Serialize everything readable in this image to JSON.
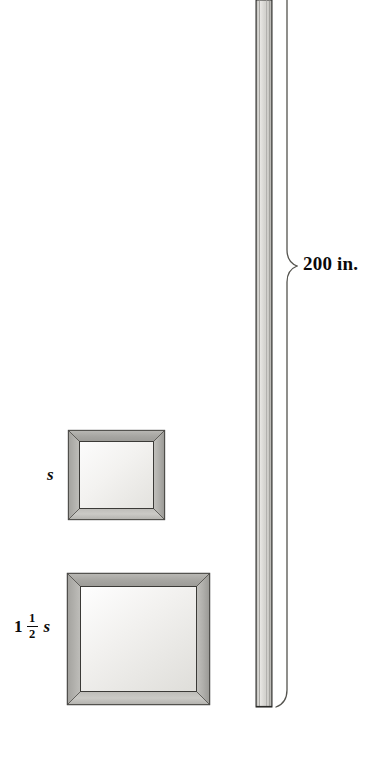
{
  "figure": {
    "type": "geometry-diagram",
    "background_color": "#ffffff",
    "width": 369,
    "height": 782
  },
  "labels": {
    "molding_length": "200 in.",
    "small_frame_side": "s",
    "large_frame_whole": "1",
    "large_frame_numerator": "1",
    "large_frame_denominator": "2",
    "large_frame_variable": "s"
  },
  "objects": {
    "small_frame": {
      "name": "small-picture-frame",
      "x": 68,
      "y": 430,
      "width": 97,
      "height": 90,
      "border_width": 11,
      "side_label": "s"
    },
    "large_frame": {
      "name": "large-picture-frame",
      "x": 67,
      "y": 573,
      "width": 143,
      "height": 132,
      "border_width": 13,
      "side_label": "1 1/2 s"
    },
    "molding_strip": {
      "name": "molding-strip",
      "x": 256,
      "y": 0,
      "width": 16,
      "height": 707,
      "length_label": "200 in."
    },
    "brace": {
      "name": "dimension-brace",
      "x": 281,
      "y_top": 0,
      "y_bottom": 707,
      "tip_y": 266,
      "tip_x": 297
    }
  },
  "colors": {
    "frame_border_light": "#d8d7d3",
    "frame_border_mid": "#a9a8a4",
    "frame_border_dark": "#8e8d89",
    "frame_interior_light": "#fafafa",
    "frame_interior_shade": "#e6e5e2",
    "outline": "#1b1b1b",
    "strip_core": "#d3d2ce",
    "strip_highlight": "#f2f1ef",
    "strip_edge": "#6f6e6b",
    "brace_stroke": "#5f5e5c",
    "text": "#0a0a0a"
  }
}
